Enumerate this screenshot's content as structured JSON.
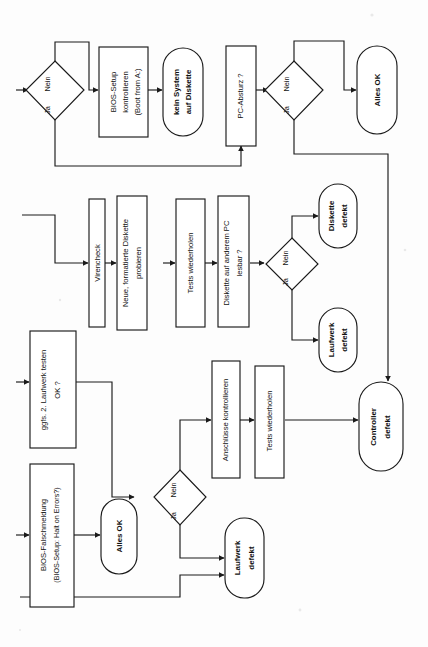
{
  "diagram": {
    "orientation": "rotated-90-ccw",
    "language": "de",
    "colors": {
      "ink": "#1a1a1a",
      "paper": "#fdfdfd",
      "node_fill": "#ffffff"
    },
    "rows": [
      {
        "id": "row-1",
        "nodes": [
          {
            "id": "n1-decision",
            "shape": "diamond",
            "text": "",
            "yes_label": "Ja",
            "no_label": "Nein"
          },
          {
            "id": "n1-bios-setup",
            "shape": "process",
            "text": "BIOS-Setup kontrollieren (Boot from A:)",
            "lines": [
              "BIOS-Setup",
              "kontrollieren",
              "(Boot from A:)"
            ]
          },
          {
            "id": "n1-kein-system",
            "shape": "terminator",
            "bold": true,
            "text": "kein System auf Diskette",
            "lines": [
              "kein System",
              "auf Diskette"
            ]
          },
          {
            "id": "n1-pc-absturz",
            "shape": "process",
            "text": "PC-Absturz ?",
            "lines": [
              "PC-Absturz ?"
            ]
          },
          {
            "id": "n1-decision2",
            "shape": "diamond",
            "text": "",
            "yes_label": "Ja",
            "no_label": "Nein"
          },
          {
            "id": "n1-alles-ok",
            "shape": "terminator",
            "bold": true,
            "text": "Alles OK",
            "lines": [
              "Alles OK"
            ]
          }
        ]
      },
      {
        "id": "row-2",
        "nodes": [
          {
            "id": "n2-virencheck",
            "shape": "process",
            "text": "Virencheck",
            "lines": [
              "Virencheck"
            ]
          },
          {
            "id": "n2-neue-diskette",
            "shape": "process",
            "text": "Neue, formatierte Diskette probieren",
            "lines": [
              "Neue, formatierte Diskette",
              "probieren"
            ]
          },
          {
            "id": "n2-tests",
            "shape": "process",
            "text": "Tests wiederholen",
            "lines": [
              "Tests wiederholen"
            ]
          },
          {
            "id": "n2-lesbar",
            "shape": "process",
            "text": "Diskette auf anderem PC lesbar ?",
            "lines": [
              "Diskette auf anderem PC",
              "lesbar ?"
            ]
          },
          {
            "id": "n2-decision",
            "shape": "diamond",
            "text": "",
            "yes_label": "Ja",
            "no_label": "Nein"
          },
          {
            "id": "n2-diskette-defekt",
            "shape": "terminator",
            "bold": true,
            "text": "Diskette defekt",
            "lines": [
              "Diskette",
              "defekt"
            ]
          },
          {
            "id": "n2-laufwerk-defekt",
            "shape": "terminator",
            "bold": true,
            "text": "Laufwerk defekt",
            "lines": [
              "Laufwerk",
              "defekt"
            ]
          }
        ]
      },
      {
        "id": "row-3",
        "nodes": [
          {
            "id": "n3-zweites-laufwerk",
            "shape": "process",
            "text": "ggfs. 2. Laufwerk testen OK ?",
            "lines": [
              "ggfs. 2. Laufwerk  testen",
              "OK ?"
            ]
          },
          {
            "id": "n3-anschluesse",
            "shape": "process",
            "text": "Anschlüsse kontrollieren",
            "lines": [
              "Anschlüsse kontrollieren"
            ]
          },
          {
            "id": "n3-tests",
            "shape": "process",
            "text": "Tests wiederholen",
            "lines": [
              "Tests wiederholen"
            ]
          },
          {
            "id": "n3-controller-defekt",
            "shape": "terminator",
            "bold": true,
            "text": "Controller defekt",
            "lines": [
              "Controller",
              "defekt"
            ]
          }
        ]
      },
      {
        "id": "row-4",
        "nodes": [
          {
            "id": "n4-bios-falsch",
            "shape": "process",
            "text": "BIOS-Falschmeldung (BIOS-Setup: Halt on Errors?)",
            "lines": [
              "BIOS-Falschmeldung",
              "(BIOS-Setup: Halt on Errors?)"
            ]
          },
          {
            "id": "n4-alles-ok",
            "shape": "terminator",
            "bold": true,
            "text": "Alles OK",
            "lines": [
              "Alles OK"
            ]
          },
          {
            "id": "n4-decision",
            "shape": "diamond",
            "text": "",
            "yes_label": "Ja",
            "no_label": "Nein"
          },
          {
            "id": "n4-laufwerk-defekt",
            "shape": "terminator",
            "bold": true,
            "text": "Laufwerk defekt",
            "lines": [
              "Laufwerk",
              "defekt"
            ]
          }
        ]
      }
    ],
    "labels": {
      "ja": "Ja",
      "nein": "Nein",
      "bios_setup_l1": "BIOS-Setup",
      "bios_setup_l2": "kontrollieren",
      "bios_setup_l3": "(Boot from A:)",
      "kein_system_l1": "kein System",
      "kein_system_l2": "auf Diskette",
      "pc_absturz": "PC-Absturz ?",
      "alles_ok": "Alles OK",
      "virencheck": "Virencheck",
      "neue_diskette_l1": "Neue, formatierte Diskette",
      "neue_diskette_l2": "probieren",
      "tests_wiederholen": "Tests wiederholen",
      "lesbar_l1": "Diskette auf anderem PC",
      "lesbar_l2": "lesbar ?",
      "diskette_defekt_l1": "Diskette",
      "diskette_defekt_l2": "defekt",
      "laufwerk_defekt_l1": "Laufwerk",
      "laufwerk_defekt_l2": "defekt",
      "zweites_laufwerk_l1": "ggfs. 2. Laufwerk  testen",
      "zweites_laufwerk_l2": "OK ?",
      "anschluesse": "Anschlüsse kontrollieren",
      "controller_defekt_l1": "Controller",
      "controller_defekt_l2": "defekt",
      "bios_falsch_l1": "BIOS-Falschmeldung",
      "bios_falsch_l2": "(BIOS-Setup: Halt on Errors?)"
    }
  }
}
